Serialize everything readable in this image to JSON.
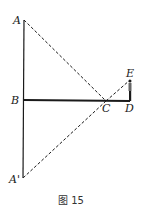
{
  "diagram": {
    "caption": "图 15",
    "labels": {
      "A": "A",
      "B": "B",
      "A_prime": "A'",
      "C": "C",
      "D": "D",
      "E": "E"
    },
    "points": {
      "A": [
        24,
        20
      ],
      "B": [
        24,
        100
      ],
      "A_prime": [
        23,
        178
      ],
      "C": [
        106,
        101
      ],
      "D": [
        130,
        101
      ],
      "E": [
        130,
        80
      ]
    },
    "segments": [
      {
        "from": "A",
        "to": "A_prime",
        "style": "solid"
      },
      {
        "from": "B",
        "to": "D",
        "style": "solid-thick"
      },
      {
        "from": "A",
        "to": "C",
        "style": "dashed"
      },
      {
        "from": "C",
        "to": "E",
        "style": "dashed"
      },
      {
        "from": "C",
        "to": "A_prime",
        "style": "dashed"
      },
      {
        "from": "D",
        "to": "E",
        "style": "person-figure"
      }
    ],
    "colors": {
      "line": "#1a1a1a"
    }
  }
}
